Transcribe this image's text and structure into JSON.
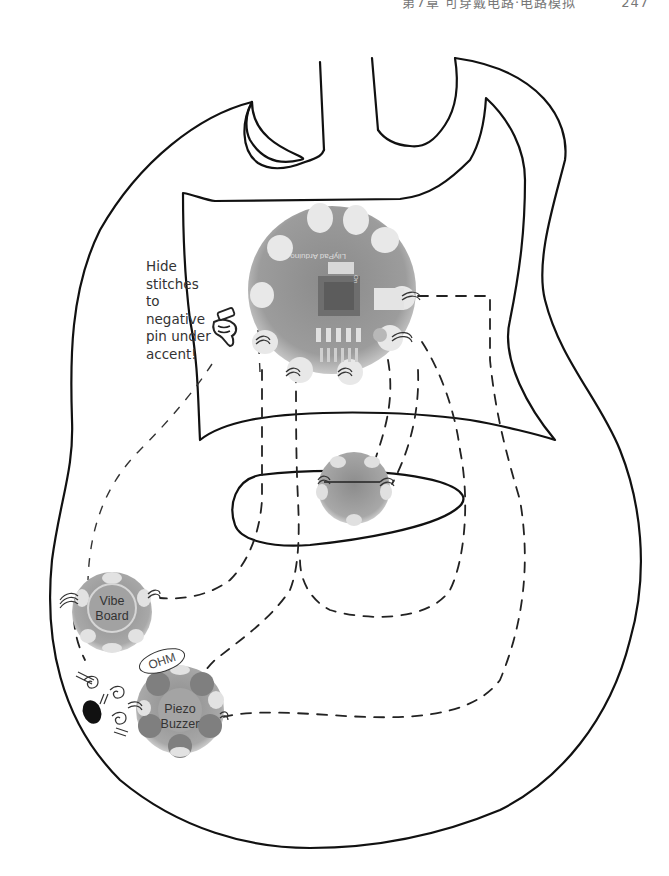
{
  "header": {
    "title": "第7章 可穿戴电路·电路模拟",
    "page_number": "247"
  },
  "diagram": {
    "annotation": {
      "lines": [
        "Hide",
        "stitches",
        "to",
        "negative",
        "pin under",
        "accent!"
      ]
    },
    "components": {
      "main_board": {
        "name": "LilyPad Arduino",
        "silkscreen": "LilyPad Arduino",
        "switch_label": "On"
      },
      "sensor_board": {
        "name": "LilyPad sensor"
      },
      "vibe_board": {
        "label_line1": "Vibe",
        "label_line2": "Board"
      },
      "piezo_buzzer": {
        "label_line1": "Piezo",
        "label_line2": "Buzzer"
      },
      "resistor": {
        "label": "OHM"
      }
    },
    "colors": {
      "outline": "#111111",
      "thread": "#222222",
      "board_fill": "#9a9a9a",
      "board_dark": "#7a7a7a",
      "led": "#e6e6e6",
      "background": "#ffffff"
    }
  }
}
